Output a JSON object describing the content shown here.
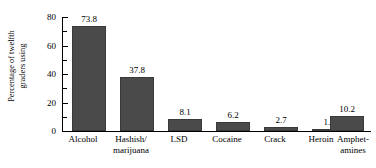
{
  "chart_data": {
    "type": "bar",
    "title": "",
    "subtitle": "",
    "xlabel": "",
    "ylabel": "Percentage of twelfth graders using",
    "ylabel_lines": [
      "Percentage of twelfth",
      "graders using"
    ],
    "categories": [
      "Alcohol",
      "Hashish/ marijuana",
      "LSD",
      "Cocaine",
      "Crack",
      "Heroin",
      "Amphet- amines"
    ],
    "category_lines": [
      [
        "Alcohol"
      ],
      [
        "Hashish/",
        "marijuana"
      ],
      [
        "LSD"
      ],
      [
        "Cocaine"
      ],
      [
        "Crack"
      ],
      [
        "Heroin"
      ],
      [
        "Amphet-",
        "amines"
      ]
    ],
    "values": [
      73.8,
      37.8,
      8.1,
      6.2,
      2.7,
      1.1,
      10.2
    ],
    "value_labels": [
      "73.8",
      "37.8",
      "8.1",
      "6.2",
      "2.7",
      "1.1",
      "10.2"
    ],
    "ylim": [
      0,
      80
    ],
    "ytick_major": [
      0,
      20,
      40,
      60,
      80
    ],
    "ytick_major_labels": [
      "0",
      "20",
      "40",
      "60",
      "80"
    ],
    "ytick_minor": [
      10,
      30,
      50,
      70
    ],
    "grid": false,
    "legend": false,
    "legend_position": "none",
    "bar_color": "#4a4a4a",
    "axis_color": "#000000",
    "background_color": "#ffffff"
  }
}
